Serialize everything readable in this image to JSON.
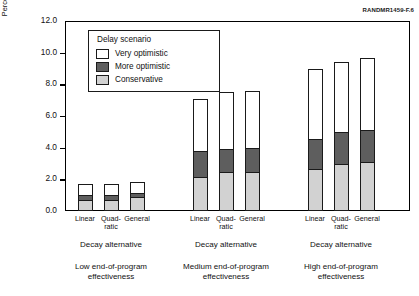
{
  "figure_id": "RANDMR1459-F.6",
  "axis": {
    "y_title_line1": "Percentage reduction in present value",
    "y_title_line2": "of consumption",
    "y_ticks": [
      "12.0",
      "10.0",
      "8.0",
      "6.0",
      "4.0",
      "2.0",
      "0.0"
    ]
  },
  "legend": {
    "title": "Delay scenario",
    "items": [
      {
        "label": "Very optimistic",
        "key": "vo",
        "color": "#ffffff"
      },
      {
        "label": "More optimistic",
        "key": "mo",
        "color": "#5e5e5e"
      },
      {
        "label": "Conservative",
        "key": "co",
        "color": "#d2d2d2"
      }
    ]
  },
  "x_axis": {
    "category_label": "Decay alternative",
    "categories": [
      "Linear",
      "Quad-\nratic",
      "General"
    ],
    "category_labels_flat": [
      "Linear",
      "Quad- ratic",
      "General"
    ],
    "groups": [
      {
        "decay_label": "Decay alternative",
        "effectiveness_line1": "Low end-of-program",
        "effectiveness_line2": "effectiveness"
      },
      {
        "decay_label": "Decay alternative",
        "effectiveness_line1": "Medium end-of-program",
        "effectiveness_line2": "effectiveness"
      },
      {
        "decay_label": "Decay alternative",
        "effectiveness_line1": "High end-of-program",
        "effectiveness_line2": "effectiveness"
      }
    ]
  },
  "chart_data": {
    "type": "bar",
    "subtype": "stacked",
    "title": "",
    "xlabel": "Decay alternative",
    "ylabel": "Percentage reduction in present value of consumption",
    "ylim": [
      0.0,
      12.0
    ],
    "ytick_step": 2.0,
    "grid": false,
    "legend_position": "upper-left-inside",
    "legend_title": "Delay scenario",
    "group_labels": [
      "Low end-of-program effectiveness",
      "Medium end-of-program effectiveness",
      "High end-of-program effectiveness"
    ],
    "categories": [
      "Linear",
      "Quadratic",
      "General"
    ],
    "series": [
      {
        "name": "Conservative",
        "color": "#d2d2d2",
        "stack_order": 1,
        "values": [
          [
            0.6,
            0.65,
            0.8
          ],
          [
            2.05,
            2.35,
            2.4
          ],
          [
            2.55,
            2.85,
            3.0
          ]
        ]
      },
      {
        "name": "More optimistic",
        "color": "#5e5e5e",
        "stack_order": 2,
        "cumulative_tops": [
          [
            1.0,
            1.05,
            1.15
          ],
          [
            3.8,
            3.95,
            3.95
          ],
          [
            4.55,
            5.0,
            5.1
          ]
        ],
        "values": [
          [
            0.4,
            0.4,
            0.35
          ],
          [
            1.75,
            1.6,
            1.55
          ],
          [
            2.0,
            2.15,
            2.1
          ]
        ]
      },
      {
        "name": "Very optimistic",
        "color": "#ffffff",
        "stack_order": 3,
        "cumulative_tops": [
          [
            1.7,
            1.7,
            1.85
          ],
          [
            7.05,
            7.5,
            7.6
          ],
          [
            9.0,
            9.4,
            9.65
          ]
        ],
        "values": [
          [
            0.7,
            0.65,
            0.7
          ],
          [
            3.25,
            3.55,
            3.65
          ],
          [
            4.45,
            4.4,
            4.55
          ]
        ]
      }
    ],
    "bar_totals": [
      [
        1.7,
        1.7,
        1.85
      ],
      [
        7.05,
        7.5,
        7.6
      ],
      [
        9.0,
        9.4,
        9.65
      ]
    ]
  }
}
